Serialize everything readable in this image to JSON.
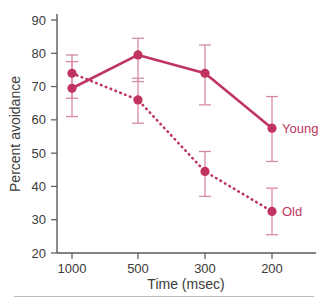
{
  "chart_data": {
    "type": "line",
    "title": "",
    "xlabel": "Time (msec)",
    "ylabel": "Percent avoidance",
    "categories": [
      "1000",
      "500",
      "300",
      "200"
    ],
    "xtick_labels": [
      "1000",
      "500",
      "300",
      "200"
    ],
    "ytick_labels": [
      "20",
      "30",
      "40",
      "50",
      "60",
      "70",
      "80",
      "90"
    ],
    "ylim": [
      20,
      90
    ],
    "ytick_step": 10,
    "grid": false,
    "legend_position": "inline-right-of-last-point",
    "series": [
      {
        "name": "Young",
        "label": "Young",
        "linestyle": "solid",
        "color": "#c0355f",
        "marker": "circle",
        "values": [
          69.5,
          79.5,
          74.0,
          57.5
        ],
        "error_low": [
          61.0,
          71.5,
          64.5,
          47.5
        ],
        "error_high": [
          77.5,
          84.5,
          82.5,
          67.0
        ]
      },
      {
        "name": "Old",
        "label": "Old",
        "linestyle": "dotted",
        "color": "#c0355f",
        "marker": "circle",
        "values": [
          74.0,
          66.0,
          44.5,
          32.5
        ],
        "error_low": [
          66.5,
          59.0,
          37.0,
          25.5
        ],
        "error_high": [
          79.5,
          72.5,
          50.5,
          39.5
        ]
      }
    ],
    "errorbar_color": "#d78aa3",
    "axis_color": "#5a5a5a",
    "text_color": "#3b3b3b",
    "background": "#ffffff"
  }
}
